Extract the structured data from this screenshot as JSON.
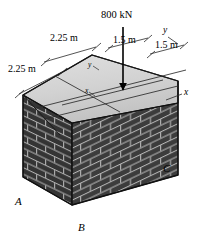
{
  "figure": {
    "background_color": "#ffffff",
    "colors": {
      "top_face": "#cfcfcf",
      "top_face_light": "#dcdcdc",
      "brick_front": "#3c3c3c",
      "brick_side": "#343434",
      "mortar": "#b8b8b8",
      "outline": "#1a1a1a",
      "text": "#000000"
    },
    "load": {
      "label": "800 kN",
      "arrow_direction": "down"
    },
    "dimensions": [
      {
        "id": "dim-left-upper",
        "label": "2.25 m"
      },
      {
        "id": "dim-left-lower",
        "label": "2.25 m"
      },
      {
        "id": "dim-right-inner",
        "label": "1.5 m"
      },
      {
        "id": "dim-right-outer",
        "label": "1.5 m"
      }
    ],
    "axes": [
      {
        "id": "axis-y-edge",
        "label": "y"
      },
      {
        "id": "axis-x-edge",
        "label": "x"
      },
      {
        "id": "axis-y-centroid",
        "label": "y"
      },
      {
        "id": "axis-x-centroid",
        "label": "x"
      }
    ],
    "corners": [
      {
        "id": "corner-a",
        "label": "A"
      },
      {
        "id": "corner-b",
        "label": "B"
      },
      {
        "id": "corner-c",
        "label": "C"
      }
    ]
  }
}
